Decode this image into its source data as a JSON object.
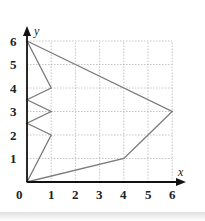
{
  "chart_data": {
    "type": "diagram",
    "title": "",
    "xlabel": "x",
    "ylabel": "y",
    "xlim": [
      0,
      6
    ],
    "ylim": [
      0,
      6
    ],
    "grid": true,
    "x_ticks": [
      "0",
      "1",
      "2",
      "3",
      "4",
      "5",
      "6"
    ],
    "y_ticks": [
      "1",
      "2",
      "3",
      "4",
      "5",
      "6"
    ],
    "polygon": [
      [
        0,
        6
      ],
      [
        6,
        3
      ],
      [
        5,
        2
      ],
      [
        4,
        1
      ],
      [
        0,
        0
      ],
      [
        1,
        2
      ],
      [
        0,
        2.5
      ],
      [
        1,
        3
      ],
      [
        0,
        3.5
      ],
      [
        1,
        4
      ],
      [
        0,
        6
      ]
    ],
    "colors": {
      "polygon": "#7a7a7a",
      "grid": "#b8b8b8",
      "axis": "#111111"
    }
  },
  "labels": {
    "x_axis": "x",
    "y_axis": "y",
    "origin": "0",
    "x1": "1",
    "x2": "2",
    "x3": "3",
    "x4": "4",
    "x5": "5",
    "x6": "6",
    "y1": "1",
    "y2": "2",
    "y3": "3",
    "y4": "4",
    "y5": "5",
    "y6": "6"
  }
}
